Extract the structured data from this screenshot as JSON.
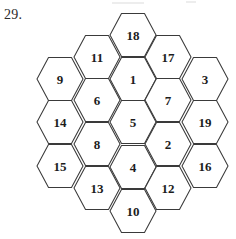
{
  "problem": {
    "number_label": "29."
  },
  "figure": {
    "name": "magic-hexagon",
    "shape": "hexagon",
    "orientation": "flat-top",
    "cell_count": 19,
    "stroke_color": "#3a3a3a",
    "fill_color": "#ffffff",
    "label_color": "#1c1c1c",
    "hex_half_width": 23,
    "hex_half_height": 21.5,
    "hex_side_inset": 11.5,
    "columns": [
      {
        "name": "column-1",
        "x": 60,
        "cells": [
          {
            "value": "9",
            "y": 79
          },
          {
            "value": "14",
            "y": 122
          },
          {
            "value": "15",
            "y": 166
          }
        ]
      },
      {
        "name": "column-2",
        "x": 97,
        "cells": [
          {
            "value": "11",
            "y": 57
          },
          {
            "value": "6",
            "y": 100
          },
          {
            "value": "8",
            "y": 144
          },
          {
            "value": "13",
            "y": 188
          }
        ]
      },
      {
        "name": "column-3",
        "x": 133,
        "cells": [
          {
            "value": "18",
            "y": 35
          },
          {
            "value": "1",
            "y": 79
          },
          {
            "value": "5",
            "y": 122
          },
          {
            "value": "4",
            "y": 167
          },
          {
            "value": "10",
            "y": 211
          }
        ]
      },
      {
        "name": "column-4",
        "x": 168,
        "cells": [
          {
            "value": "17",
            "y": 57
          },
          {
            "value": "7",
            "y": 100
          },
          {
            "value": "2",
            "y": 144
          },
          {
            "value": "12",
            "y": 188
          }
        ]
      },
      {
        "name": "column-5",
        "x": 205,
        "cells": [
          {
            "value": "3",
            "y": 79
          },
          {
            "value": "19",
            "y": 122
          },
          {
            "value": "16",
            "y": 166
          }
        ]
      }
    ]
  },
  "artifacts": [
    {
      "x": 112,
      "y": 2,
      "w": 32,
      "h": 2
    },
    {
      "x": 186,
      "y": 1,
      "w": 10,
      "h": 2
    }
  ]
}
